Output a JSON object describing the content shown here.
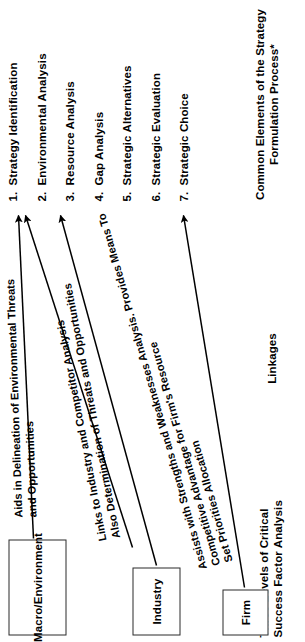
{
  "figure": {
    "headings": {
      "levels": "Three Levels of Critical\nSuccess Factor Analysis",
      "linkages": "Linkages",
      "elements": "Common Elements of the Strategy\nFormulation Process*"
    },
    "levels": [
      {
        "id": "macro",
        "label": "Macro/Environment"
      },
      {
        "id": "industry",
        "label": "Industry"
      },
      {
        "id": "firm",
        "label": "Firm"
      }
    ],
    "linkages": [
      {
        "from": "macro",
        "text": "Aids in Delineation of Environmental Threats\nand Opportunities"
      },
      {
        "from": "industry",
        "text": "Links to Industry and Competitor Analysis\nAlso Determination of Threats and Opportunities"
      },
      {
        "from": "firm",
        "text": "Assists with Strengths and Weaknesses Analysis. Provides Means To\nCompetitive Advantage for Firm's Resource\nSet Priorities Allocation"
      }
    ],
    "elements": [
      {
        "num": "1.",
        "label": "Strategy Identification"
      },
      {
        "num": "2.",
        "label": "Environmental Analysis"
      },
      {
        "num": "3.",
        "label": "Resource Analysis"
      },
      {
        "num": "4.",
        "label": "Gap Analysis"
      },
      {
        "num": "5.",
        "label": "Strategic Alternatives"
      },
      {
        "num": "6.",
        "label": "Strategic Evaluation"
      },
      {
        "num": "7.",
        "label": "Strategic Choice"
      }
    ],
    "colors": {
      "ink": "#000000",
      "box_border": "#2b2b2b",
      "background": "#ffffff"
    },
    "arrows": [
      {
        "id": "macro-to-environmental-analysis",
        "target": "2. Environmental Analysis"
      },
      {
        "id": "macro-to-environmental-analysis-b",
        "target": "2. Environmental Analysis"
      },
      {
        "id": "industry-to-resource-analysis",
        "target": "3. Resource Analysis"
      },
      {
        "id": "firm-to-strategic-evaluation",
        "target": "6. Strategic Evaluation"
      }
    ]
  }
}
